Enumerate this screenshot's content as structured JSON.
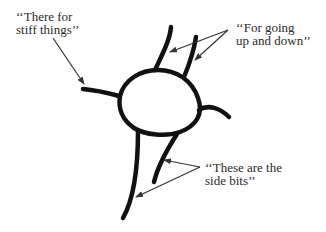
{
  "diagram": {
    "type": "annotated-drawing",
    "colors": {
      "stroke": "#111111",
      "text": "#2a2a2a",
      "arrow": "#333333",
      "background": "#ffffff"
    },
    "labels": [
      {
        "id": "stiff",
        "lines": [
          "‘‘There for",
          "stiff things’’"
        ]
      },
      {
        "id": "updown",
        "lines": [
          "‘‘For going",
          "up and down’’"
        ]
      },
      {
        "id": "side",
        "lines": [
          "‘‘These are the",
          "side bits’’"
        ]
      }
    ]
  }
}
